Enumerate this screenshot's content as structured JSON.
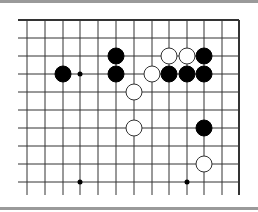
{
  "board": {
    "grid": {
      "columns_x": [
        27,
        45,
        63,
        80,
        98,
        116,
        134,
        152,
        169,
        187,
        204,
        222,
        239
      ],
      "rows_y": [
        20,
        38,
        56,
        74,
        92,
        110,
        128,
        146,
        164,
        182
      ],
      "left_x": 18,
      "bottom_y": 195,
      "top_edge": true,
      "right_edge": true
    },
    "stones": [
      {
        "color": "black",
        "col": 5,
        "row": 2
      },
      {
        "color": "white",
        "col": 8,
        "row": 2
      },
      {
        "color": "white",
        "col": 9,
        "row": 2
      },
      {
        "color": "black",
        "col": 10,
        "row": 2
      },
      {
        "color": "black",
        "col": 2,
        "row": 3
      },
      {
        "color": "black",
        "col": 5,
        "row": 3
      },
      {
        "color": "white",
        "col": 7,
        "row": 3
      },
      {
        "color": "black",
        "col": 8,
        "row": 3
      },
      {
        "color": "black",
        "col": 9,
        "row": 3
      },
      {
        "color": "black",
        "col": 10,
        "row": 3
      },
      {
        "color": "white",
        "col": 6,
        "row": 4
      },
      {
        "color": "white",
        "col": 6,
        "row": 6
      },
      {
        "color": "black",
        "col": 10,
        "row": 6
      },
      {
        "color": "white",
        "col": 10,
        "row": 8
      }
    ],
    "star_points": [
      {
        "col": 3,
        "row": 3
      },
      {
        "col": 3,
        "row": 9
      },
      {
        "col": 9,
        "row": 9
      }
    ]
  }
}
